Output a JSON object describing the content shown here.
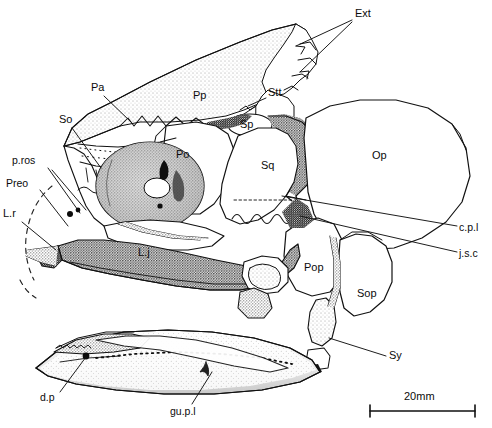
{
  "figure": {
    "background_color": "#ffffff",
    "ink_color": "#111111"
  },
  "scale_bar": {
    "label": "20mm",
    "length_px": 105
  },
  "labels": [
    {
      "id": "ext",
      "text": "Ext",
      "x": 355,
      "y": 14,
      "anchor": "start"
    },
    {
      "id": "pa",
      "text": "Pa",
      "x": 91,
      "y": 88,
      "anchor": "start"
    },
    {
      "id": "pp",
      "text": "Pp",
      "x": 195,
      "y": 96,
      "anchor": "start"
    },
    {
      "id": "stt",
      "text": "Stt",
      "x": 268,
      "y": 93,
      "anchor": "start"
    },
    {
      "id": "so",
      "text": "So",
      "x": 59,
      "y": 120,
      "anchor": "start"
    },
    {
      "id": "sp",
      "text": "Sp",
      "x": 240,
      "y": 120,
      "anchor": "start"
    },
    {
      "id": "po",
      "text": "Po",
      "x": 176,
      "y": 155,
      "anchor": "start"
    },
    {
      "id": "pros",
      "text": "p.ros",
      "x": 16,
      "y": 160,
      "anchor": "start"
    },
    {
      "id": "sq",
      "text": "Sq",
      "x": 262,
      "y": 166,
      "anchor": "start"
    },
    {
      "id": "op",
      "text": "Op",
      "x": 372,
      "y": 155,
      "anchor": "start"
    },
    {
      "id": "preo",
      "text": "Preo",
      "x": 8,
      "y": 184,
      "anchor": "start"
    },
    {
      "id": "lr",
      "text": "L.r",
      "x": 4,
      "y": 214,
      "anchor": "start"
    },
    {
      "id": "lj",
      "text": "L.j",
      "x": 138,
      "y": 253,
      "anchor": "start"
    },
    {
      "id": "cpl",
      "text": "c.p.l",
      "x": 460,
      "y": 228,
      "anchor": "start"
    },
    {
      "id": "jsc",
      "text": "j.s.c",
      "x": 460,
      "y": 254,
      "anchor": "start"
    },
    {
      "id": "pop",
      "text": "Pop",
      "x": 305,
      "y": 268,
      "anchor": "start"
    },
    {
      "id": "sop",
      "text": "Sop",
      "x": 357,
      "y": 294,
      "anchor": "start"
    },
    {
      "id": "sy",
      "text": "Sy",
      "x": 389,
      "y": 356,
      "anchor": "start"
    },
    {
      "id": "dp",
      "text": "d.p",
      "x": 42,
      "y": 398,
      "anchor": "start"
    },
    {
      "id": "gupl",
      "text": "gu.p.l",
      "x": 173,
      "y": 412,
      "anchor": "start"
    }
  ],
  "leader_lines": [
    {
      "id": "ext-1",
      "from": [
        352,
        20
      ],
      "to": [
        296,
        46
      ]
    },
    {
      "id": "ext-2",
      "from": [
        352,
        22
      ],
      "to": [
        300,
        72
      ]
    },
    {
      "id": "pa",
      "from": [
        104,
        96
      ],
      "to": [
        131,
        122
      ]
    },
    {
      "id": "stt",
      "from": [
        266,
        98
      ],
      "to": [
        244,
        107
      ]
    },
    {
      "id": "so",
      "from": [
        72,
        128
      ],
      "to": [
        101,
        168
      ]
    },
    {
      "id": "pros",
      "from": [
        48,
        168
      ],
      "to": [
        78,
        214
      ]
    },
    {
      "id": "pros2",
      "from": [
        50,
        170
      ],
      "to": [
        84,
        212
      ]
    },
    {
      "id": "preo",
      "from": [
        40,
        190
      ],
      "to": [
        67,
        224
      ]
    },
    {
      "id": "lr",
      "from": [
        22,
        222
      ],
      "to": [
        55,
        248
      ]
    },
    {
      "id": "cpl",
      "from": [
        457,
        226
      ],
      "to": [
        282,
        196
      ]
    },
    {
      "id": "jsc",
      "from": [
        457,
        252
      ],
      "to": [
        300,
        216
      ]
    },
    {
      "id": "sy",
      "from": [
        386,
        356
      ],
      "to": [
        329,
        338
      ]
    },
    {
      "id": "dp",
      "from": [
        60,
        392
      ],
      "to": [
        86,
        356
      ]
    },
    {
      "id": "gupl",
      "from": [
        192,
        404
      ],
      "to": [
        213,
        370
      ]
    }
  ],
  "bones": [
    {
      "id": "pp",
      "name": "parietal-postparietal-shield"
    },
    {
      "id": "stt",
      "name": "supratemporal"
    },
    {
      "id": "sp",
      "name": "spiracular"
    },
    {
      "id": "po",
      "name": "postorbital"
    },
    {
      "id": "sq",
      "name": "squamosal"
    },
    {
      "id": "op",
      "name": "opercle"
    },
    {
      "id": "pop",
      "name": "preopercle"
    },
    {
      "id": "sop",
      "name": "subopercle"
    },
    {
      "id": "lj",
      "name": "lower-jaw"
    },
    {
      "id": "gupl",
      "name": "gular-plate"
    }
  ]
}
